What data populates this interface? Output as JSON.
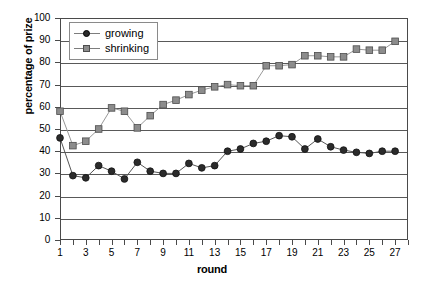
{
  "chart_data": {
    "type": "line",
    "title": "",
    "xlabel": "round",
    "ylabel": "percentage of prize",
    "xlim": [
      1,
      28
    ],
    "ylim": [
      0,
      100
    ],
    "grid": true,
    "legend_position": "top-left",
    "x": [
      1,
      2,
      3,
      4,
      5,
      6,
      7,
      8,
      9,
      10,
      11,
      12,
      13,
      14,
      15,
      16,
      17,
      18,
      19,
      20,
      21,
      22,
      23,
      24,
      25,
      26,
      27
    ],
    "xtick_labels": [
      "1",
      "3",
      "5",
      "7",
      "9",
      "11",
      "13",
      "15",
      "17",
      "19",
      "21",
      "23",
      "25",
      "27"
    ],
    "xtick_values": [
      1,
      3,
      5,
      7,
      9,
      11,
      13,
      15,
      17,
      19,
      21,
      23,
      25,
      27
    ],
    "ytick_labels": [
      "0",
      "10",
      "20",
      "30",
      "40",
      "50",
      "60",
      "70",
      "80",
      "90",
      "100"
    ],
    "ytick_values": [
      0,
      10,
      20,
      30,
      40,
      50,
      60,
      70,
      80,
      90,
      100
    ],
    "series": [
      {
        "name": "growing",
        "marker": "circle",
        "color": "#2b2b2b",
        "line_color": "#555555",
        "values": [
          46,
          29,
          28,
          33.5,
          31,
          27.5,
          35,
          31,
          30,
          30,
          34.5,
          32.5,
          33.5,
          40,
          41,
          43.5,
          44.5,
          47,
          46.5,
          41,
          45.5,
          42,
          40.5,
          39.5,
          39,
          40,
          40
        ]
      },
      {
        "name": "shrinking",
        "marker": "square",
        "color": "#8c8c8c",
        "line_color": "#999999",
        "values": [
          58,
          42.5,
          44.5,
          50,
          59.5,
          58,
          50.5,
          56,
          61,
          63,
          65.5,
          67.5,
          69,
          70,
          69.5,
          69.5,
          78.5,
          78.5,
          79,
          83,
          83,
          82.5,
          82.5,
          86,
          85.5,
          85.5,
          89.5
        ]
      }
    ]
  },
  "legend": {
    "items": [
      {
        "label": "growing"
      },
      {
        "label": "shrinking"
      }
    ]
  },
  "axes": {
    "x_title": "round",
    "y_title": "percentage of prize"
  }
}
